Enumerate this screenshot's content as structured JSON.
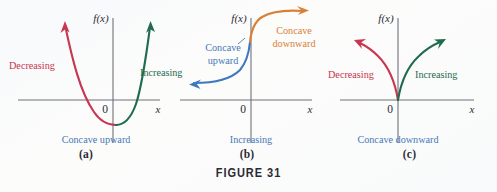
{
  "figure": {
    "caption": "FIGURE 31",
    "background_color": "#fbfcfd"
  },
  "colors": {
    "decreasing_red": "#c8364f",
    "increasing_green": "#1f6b4e",
    "concave_blue": "#4679b8",
    "concave_orange": "#d98036",
    "axis_gray": "#6f7279",
    "text_dark": "#2b2b33"
  },
  "panels": [
    {
      "key": "a",
      "sub_label": "(a)",
      "y_axis_label": "f(x)",
      "x_axis_label": "x",
      "origin_label": "0",
      "annotations": {
        "left": "Decreasing",
        "right": "Increasing",
        "bottom": "Concave upward"
      },
      "description": "Upward-opening parabola: decreasing then increasing, concave upward throughout"
    },
    {
      "key": "b",
      "sub_label": "(b)",
      "y_axis_label": "f(x)",
      "x_axis_label": "x",
      "origin_label": "0",
      "annotations": {
        "left": "Concave upward",
        "left_line1": "Concave",
        "left_line2": "upward",
        "right": "Concave downward",
        "right_line1": "Concave",
        "right_line2": "downward",
        "bottom": "Increasing"
      },
      "description": "S-shaped increasing curve: concave upward left of origin, concave downward right of origin"
    },
    {
      "key": "c",
      "sub_label": "(c)",
      "y_axis_label": "f(x)",
      "x_axis_label": "x",
      "origin_label": "0",
      "annotations": {
        "left": "Decreasing",
        "right": "Increasing",
        "bottom": "Concave downward"
      },
      "description": "Cusp at origin: decreasing arc up-left, increasing arc up-right, concave downward on both sides"
    }
  ]
}
